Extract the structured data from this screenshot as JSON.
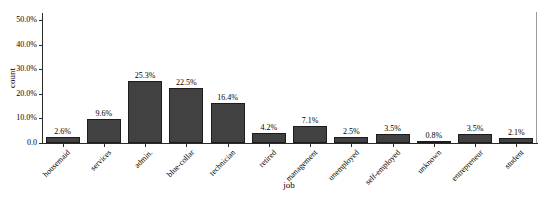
{
  "chart_data": {
    "type": "bar",
    "title": "",
    "xlabel": "job",
    "ylabel": "count",
    "categories": [
      "housemaid",
      "services",
      "admin.",
      "blue-collar",
      "technician",
      "retired",
      "management",
      "unemployed",
      "self-employed",
      "unknown",
      "entrepreneur",
      "student"
    ],
    "values": [
      2.6,
      9.6,
      25.3,
      22.5,
      16.4,
      4.2,
      7.1,
      2.5,
      3.5,
      0.8,
      3.5,
      2.1
    ],
    "bar_labels": [
      "2.6%",
      "9.6%",
      "25.3%",
      "22.5%",
      "16.4%",
      "4.2%",
      "7.1%",
      "2.5%",
      "3.5%",
      "0.8%",
      "3.5%",
      "2.1%"
    ],
    "y_ticks": [
      {
        "label": "0.0",
        "value": 0
      },
      {
        "label": "10.0%",
        "value": 10
      },
      {
        "label": "20.0%",
        "value": 20
      },
      {
        "label": "30.0%",
        "value": 30
      },
      {
        "label": "40.0%",
        "value": 40
      },
      {
        "label": "50.0%",
        "value": 50
      }
    ],
    "ylim": [
      0,
      53
    ],
    "grid": false,
    "legend": false,
    "colors": {
      "bar_fill": "#414141",
      "bar_border": "#1c1c1c",
      "axis": "#2a2a2a",
      "panel_right_border": "#9a9a9a",
      "text": "#000000"
    }
  }
}
